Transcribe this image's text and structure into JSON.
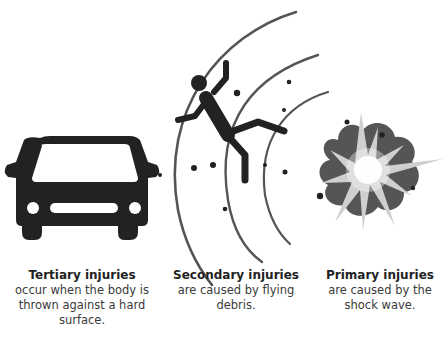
{
  "diagram": {
    "title_fragment": "",
    "colors": {
      "ink": "#222222",
      "arc": "#555555",
      "smoke": "#555555",
      "flash": "#ffffff",
      "text": "#3a3a3a"
    },
    "panels": [
      {
        "id": "tertiary",
        "icon": "car-icon",
        "title": "Tertiary injuries",
        "description": "occur when the body is thrown against a hard surface."
      },
      {
        "id": "secondary",
        "icon": "falling-person-icon",
        "title": "Secondary injuries",
        "description": "are caused by flying debris."
      },
      {
        "id": "primary",
        "icon": "explosion-icon",
        "title": "Primary injuries",
        "description": "are caused by the shock wave."
      }
    ]
  }
}
